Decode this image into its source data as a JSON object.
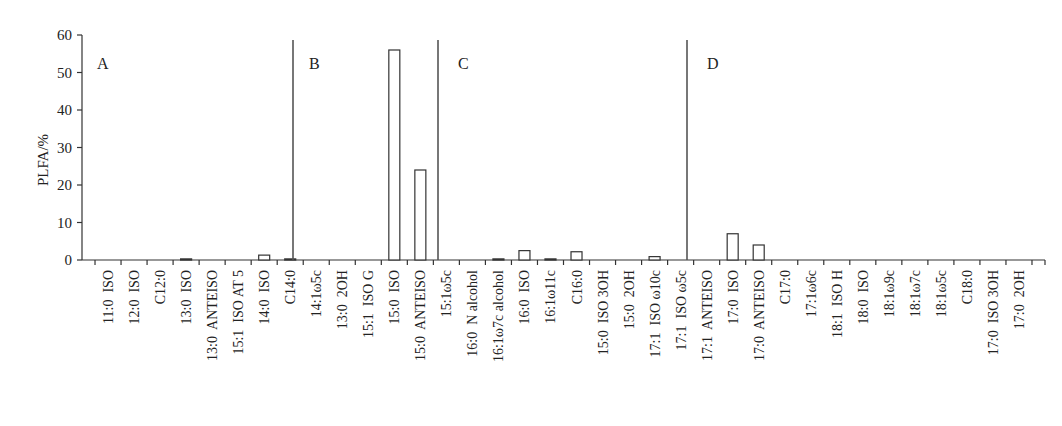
{
  "chart_data": {
    "type": "bar",
    "title": "",
    "xlabel": "",
    "ylabel": "PLFA/%",
    "ylim": [
      0,
      60
    ],
    "yticks": [
      0,
      10,
      20,
      30,
      40,
      50,
      60
    ],
    "grid": false,
    "legend": null,
    "categories": [
      "11:0  ISO",
      "12:0  ISO",
      "C12:0",
      "13:0  ISO",
      "13:0  ANTEISO",
      "15:1  ISO AT 5",
      "14:0  ISO",
      "C14:0",
      "14:1ω5c",
      "13:0  2OH",
      "15:1  ISO G",
      "15:0  ISO",
      "15:0  ANTEISO",
      "15:1ω5c",
      "16:0  N alcohol",
      "16:1ω7c alcohol",
      "16:0  ISO",
      "16:1ω11c",
      "C16:0",
      "15:0  ISO 3OH",
      "15:0  2OH",
      "17:1  ISO ω10c",
      "17:1  ISO ω5c",
      "17:1  ANTEISO",
      "17:0  ISO",
      "17:0  ANTEISO",
      "C17:0",
      "17:1ω6c",
      "18:1  ISO H",
      "18:0  ISO",
      "18:1ω9c",
      "18:1ω7c",
      "18:1ω5c",
      "C18:0",
      "17:0  ISO 3OH",
      "17:0  2OH"
    ],
    "values": [
      0,
      0,
      0,
      0.3,
      0,
      0,
      1.3,
      0.3,
      0,
      0,
      0,
      56,
      24,
      0,
      0,
      0.3,
      2.5,
      0.3,
      2.2,
      0,
      0,
      0.9,
      0,
      0,
      7,
      4,
      0,
      0,
      0,
      0,
      0,
      0,
      0,
      0,
      0,
      0
    ],
    "sections": [
      {
        "label": "A",
        "start_index": 0
      },
      {
        "label": "B",
        "start_index": 8
      },
      {
        "label": "C",
        "start_index": 13
      },
      {
        "label": "D",
        "start_index": 22
      }
    ],
    "dividers_at_index": [
      7.5,
      13,
      22
    ],
    "bar_style": {
      "fill": "#ffffff",
      "stroke": "#333333"
    }
  }
}
